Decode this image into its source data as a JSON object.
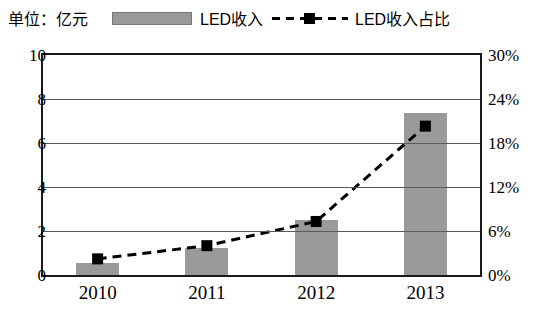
{
  "header": {
    "unit_label": "单位：亿元",
    "legend": [
      {
        "name": "bar-series-legend",
        "label": "LED收入",
        "symbol": "filled-bar-swatch",
        "color": "#9a9a9a"
      },
      {
        "name": "line-series-legend",
        "label": "LED收入占比",
        "symbol": "dashed-line-square-marker",
        "color": "#000000"
      }
    ]
  },
  "chart_data": {
    "type": "bar",
    "title": "",
    "subtitle": "",
    "xlabel": "",
    "ylabel": "单位：亿元",
    "y2label": "",
    "categories": [
      "2010",
      "2011",
      "2012",
      "2013"
    ],
    "grid": true,
    "legend_position": "top",
    "series": [
      {
        "name": "LED收入",
        "type": "bar",
        "axis": "left",
        "color": "#9a9a9a",
        "values": [
          0.55,
          1.25,
          2.5,
          7.35
        ],
        "unit": "亿元"
      },
      {
        "name": "LED收入占比",
        "type": "line",
        "axis": "right",
        "color": "#000000",
        "line_style": "dashed",
        "marker": "square",
        "values": [
          2.2,
          4.0,
          7.3,
          20.3
        ],
        "unit": "%"
      }
    ],
    "ylim": [
      0,
      10
    ],
    "yticks": [
      0,
      2,
      4,
      6,
      8,
      10
    ],
    "ytick_labels": [
      "0",
      "2",
      "4",
      "6",
      "8",
      "10"
    ],
    "y2lim": [
      0,
      30
    ],
    "y2ticks": [
      0,
      6,
      12,
      18,
      24,
      30
    ],
    "y2tick_labels": [
      "0%",
      "6%",
      "12%",
      "18%",
      "24%",
      "30%"
    ]
  }
}
